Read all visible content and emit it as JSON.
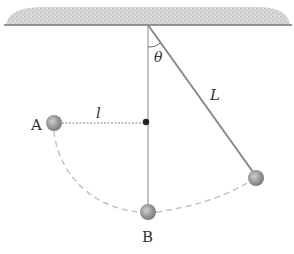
{
  "figure": {
    "type": "pendulum-with-peg",
    "labels": {
      "point_a": "A",
      "point_b": "B",
      "short_length": "l",
      "long_length": "L",
      "angle": "θ"
    },
    "colors": {
      "ceiling_fill": "#c8c8c8",
      "ceiling_line": "#777777",
      "string": "#8a8a8a",
      "vertical_line": "#aaaaaa",
      "dashed_path": "#c4c4c4",
      "bob": "#9a9a9a",
      "peg": "#222222",
      "label": "#333333"
    },
    "geometry": {
      "pivot": [
        148,
        25
      ],
      "peg": [
        146,
        122
      ],
      "bob_start": [
        256,
        178
      ],
      "point_a": [
        54,
        123
      ],
      "point_b": [
        148,
        212
      ],
      "bob_radius": 8
    }
  }
}
